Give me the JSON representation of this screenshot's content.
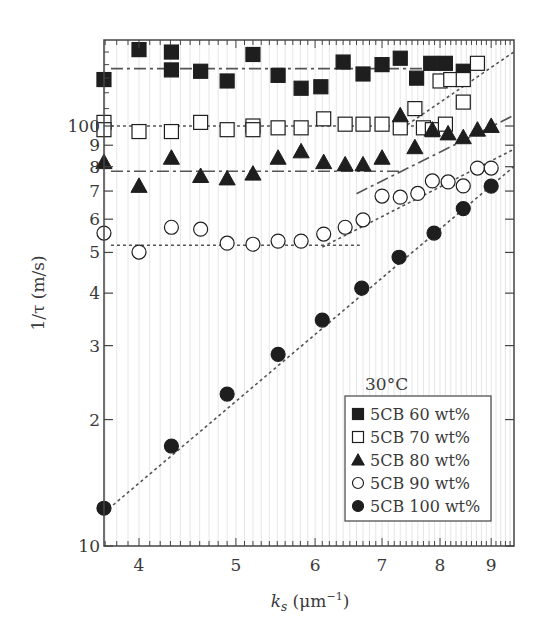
{
  "chart_data": {
    "type": "scatter",
    "title": "",
    "xlabel": "k_s (μm⁻¹)",
    "xlabel_main": "k",
    "xlabel_sub": "s",
    "xlabel_unit": " (μm",
    "xlabel_exp": "−1",
    "xlabel_close": ")",
    "ylabel": "1/τ (m/s)",
    "xscale": "log",
    "yscale": "log",
    "xlim": [
      3.69,
      9.48
    ],
    "ylim": [
      10,
      160
    ],
    "x_ticks": [
      4,
      5,
      6,
      7,
      8,
      9
    ],
    "x_tick_labels": [
      "4",
      "5",
      "6",
      "7",
      "8",
      "9"
    ],
    "y_ticks": [
      10,
      20,
      30,
      40,
      50,
      60,
      70,
      80,
      90,
      100
    ],
    "y_tick_labels": [
      "10",
      "2",
      "3",
      "4",
      "5",
      "6",
      "7",
      "8",
      "9",
      "100"
    ],
    "grid": "vertical minor lines",
    "annotation": "30°C",
    "legend_position": "lower right",
    "series": [
      {
        "name": "5CB 60 wt%",
        "marker": "filled-square",
        "x": [
          3.69,
          4.0,
          4.31,
          4.31,
          4.61,
          4.9,
          5.2,
          5.51,
          5.81,
          6.08,
          6.4,
          6.7,
          7.0,
          7.3,
          7.58,
          7.83,
          8.1,
          8.44
        ],
        "y": [
          129,
          152,
          150,
          136,
          135,
          128,
          148,
          132,
          123,
          124,
          142,
          133,
          140,
          145,
          130,
          141,
          141,
          135
        ]
      },
      {
        "name": "5CB 70 wt%",
        "marker": "open-square",
        "x": [
          3.69,
          3.69,
          4.0,
          4.31,
          4.61,
          4.9,
          5.2,
          5.2,
          5.51,
          5.81,
          6.12,
          6.43,
          6.7,
          7.0,
          7.3,
          7.55,
          7.7,
          7.86,
          8.0,
          8.1,
          8.2,
          8.44,
          8.44,
          8.72
        ],
        "y": [
          102,
          98,
          97,
          97,
          102,
          98,
          100,
          98,
          99,
          99,
          104,
          101,
          101,
          101,
          99,
          110,
          99,
          98,
          128,
          101,
          129,
          114,
          129,
          141
        ]
      },
      {
        "name": "5CB 80 wt%",
        "marker": "filled-triangle",
        "x": [
          3.69,
          4.0,
          4.31,
          4.61,
          4.9,
          5.2,
          5.51,
          5.81,
          6.12,
          6.43,
          6.7,
          7.0,
          7.3,
          7.55,
          7.86,
          8.15,
          8.44,
          8.72,
          9.0
        ],
        "y": [
          82,
          72,
          84,
          76,
          75,
          77,
          84,
          87,
          82,
          81,
          81,
          84,
          106,
          89,
          98,
          96,
          94,
          98,
          100
        ]
      },
      {
        "name": "5CB 90 wt%",
        "marker": "open-circle",
        "x": [
          3.69,
          4.0,
          4.31,
          4.61,
          4.9,
          5.2,
          5.51,
          5.81,
          6.12,
          6.43,
          6.7,
          7.0,
          7.3,
          7.6,
          7.86,
          8.15,
          8.44,
          8.72,
          9.0
        ],
        "y": [
          55.6,
          50.1,
          57.4,
          56.8,
          52.6,
          52.3,
          53.2,
          53.2,
          55.3,
          57.4,
          59.8,
          68.1,
          67.7,
          69.1,
          74.0,
          73.6,
          72.0,
          79.4,
          79.4
        ]
      },
      {
        "name": "5CB 100 wt%",
        "marker": "filled-circle",
        "x": [
          3.69,
          4.31,
          4.9,
          5.51,
          6.1,
          6.68,
          7.28,
          7.89,
          8.44,
          9.0
        ],
        "y": [
          12.3,
          17.3,
          23.0,
          28.6,
          34.5,
          41.1,
          48.7,
          55.6,
          63.6,
          71.9
        ]
      }
    ],
    "fit_lines": [
      {
        "series": "5CB 60 wt%",
        "style": "dash-dot",
        "x": [
          3.75,
          8.6
        ],
        "y": [
          137,
          137
        ]
      },
      {
        "series": "5CB 70 wt%",
        "style": "dotted",
        "x": [
          3.75,
          7.7
        ],
        "y": [
          100,
          100
        ]
      },
      {
        "series": "5CB 80 wt%",
        "style": "dash-dot",
        "x": [
          3.75,
          7.3
        ],
        "y": [
          78,
          78
        ]
      },
      {
        "series": "5CB 90 wt%",
        "style": "dotted",
        "x": [
          3.75,
          6.65
        ],
        "y": [
          52,
          52
        ]
      },
      {
        "series": "5CB 100 wt%",
        "style": "dotted",
        "x": [
          3.69,
          9.48
        ],
        "y": [
          12.0,
          80.0
        ]
      },
      {
        "series": "5CB 90 wt% (high k)",
        "style": "dotted",
        "x": [
          6.1,
          9.48
        ],
        "y": [
          51.5,
          88.0
        ]
      },
      {
        "series": "5CB 80 wt% (high k)",
        "style": "dash-dot",
        "x": [
          6.6,
          9.48
        ],
        "y": [
          69.0,
          106.0
        ]
      },
      {
        "series": "5CB 70 wt% (high k)",
        "style": "dotted",
        "x": [
          7.25,
          9.48
        ],
        "y": [
          97.0,
          150.0
        ]
      }
    ]
  },
  "legend": {
    "title": "30°C",
    "items": [
      {
        "label": "5CB 60 wt%",
        "marker": "filled-square"
      },
      {
        "label": "5CB 70 wt%",
        "marker": "open-square"
      },
      {
        "label": "5CB 80 wt%",
        "marker": "filled-triangle"
      },
      {
        "label": "5CB 90 wt%",
        "marker": "open-circle"
      },
      {
        "label": "5CB 100 wt%",
        "marker": "filled-circle"
      }
    ]
  },
  "colors": {
    "marker": "#1e1e1e",
    "axis": "#444444",
    "grid": "#e6e6e6",
    "line": "#555555"
  }
}
